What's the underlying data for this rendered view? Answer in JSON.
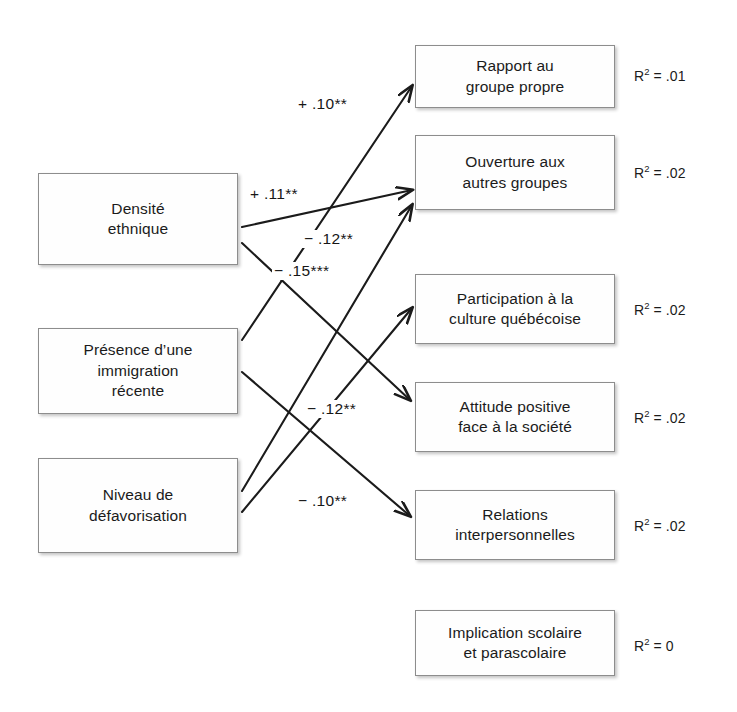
{
  "diagram": {
    "kind": "path-analysis-diagram",
    "language": "fr",
    "background_color": "#ffffff",
    "line_color": "#1b1b1b",
    "box_border_color": "#8d8d8d"
  },
  "predictors": [
    {
      "id": "densite-ethnique",
      "label": "Densité\nethnique",
      "x": 38,
      "y": 173,
      "w": 200,
      "h": 92
    },
    {
      "id": "immigration-recente",
      "label": "Présence d’une\nimmigration\nrécente",
      "x": 38,
      "y": 328,
      "w": 200,
      "h": 86
    },
    {
      "id": "niveau-defavorisation",
      "label": "Niveau de\ndéfavorisation",
      "x": 38,
      "y": 458,
      "w": 200,
      "h": 95
    }
  ],
  "outcomes": [
    {
      "id": "rapport-groupe-propre",
      "label": "Rapport au\ngroupe propre",
      "x": 415,
      "y": 45,
      "w": 200,
      "h": 63,
      "r2_prefix": "R",
      "r2_exp": "2",
      "r2_value": " = .01",
      "r2_x": 634,
      "r2_y": 68
    },
    {
      "id": "ouverture-autres-groupes",
      "label": "Ouverture aux\nautres groupes",
      "x": 415,
      "y": 135,
      "w": 200,
      "h": 75,
      "r2_prefix": "R",
      "r2_exp": "2",
      "r2_value": " = .02",
      "r2_x": 634,
      "r2_y": 165,
      "r2_v2": " = .02"
    },
    {
      "id": "participation-culture-quebecoise",
      "label": "Participation à la\nculture québécoise",
      "x": 415,
      "y": 274,
      "w": 200,
      "h": 70,
      "r2_prefix": "R",
      "r2_exp": "2",
      "r2_value": " = .02",
      "r2_x": 634,
      "r2_y": 302
    },
    {
      "id": "attitude-positive-societe",
      "label": "Attitude positive\nface à la société",
      "x": 415,
      "y": 382,
      "w": 200,
      "h": 70,
      "r2_prefix": "R",
      "r2_exp": "2",
      "r2_value": " = .02",
      "r2_x": 634,
      "r2_y": 410
    },
    {
      "id": "relations-interpersonnelles",
      "label": "Relations\ninterpersonnelles",
      "x": 415,
      "y": 490,
      "w": 200,
      "h": 70,
      "r2_prefix": "R",
      "r2_exp": "2",
      "r2_value": " = .02",
      "r2_x": 634,
      "r2_y": 518
    },
    {
      "id": "implication-scolaire",
      "label": "Implication scolaire\net parascolaire",
      "x": 415,
      "y": 610,
      "w": 200,
      "h": 66,
      "r2_prefix": "R",
      "r2_exp": "2",
      "r2_value": " = 0",
      "r2_x": 634,
      "r2_y": 638
    }
  ],
  "paths": [
    {
      "id": "path-immigration-to-rapport",
      "from": "immigration-recente",
      "to": "rapport-groupe-propre",
      "coefficient": "+ .10**",
      "sign": "positive",
      "x1": 242,
      "y1": 340,
      "x2": 412,
      "y2": 86,
      "label_x": 296,
      "label_y": 95
    },
    {
      "id": "path-densite-to-ouverture",
      "from": "densite-ethnique",
      "to": "ouverture-autres-groupes",
      "coefficient": "+ .11**",
      "sign": "positive",
      "x1": 242,
      "y1": 227,
      "x2": 412,
      "y2": 190,
      "label_x": 248,
      "label_y": 185
    },
    {
      "id": "path-densite-to-attitude",
      "from": "densite-ethnique",
      "to": "attitude-positive-societe",
      "coefficient": "− .12**",
      "sign": "negative",
      "x1": 242,
      "y1": 243,
      "x2": 410,
      "y2": 400,
      "label_x": 302,
      "label_y": 230
    },
    {
      "id": "path-defavorisation-to-ouverture",
      "from": "niveau-defavorisation",
      "to": "ouverture-autres-groupes",
      "coefficient": "− .15***",
      "sign": "negative",
      "x1": 242,
      "y1": 491,
      "x2": 412,
      "y2": 205,
      "label_x": 272,
      "label_y": 262
    },
    {
      "id": "path-defavorisation-to-participation",
      "from": "niveau-defavorisation",
      "to": "participation-culture-quebecoise",
      "coefficient": "− .12**",
      "sign": "negative",
      "x1": 242,
      "y1": 512,
      "x2": 412,
      "y2": 308,
      "label_x": 305,
      "label_y": 400
    },
    {
      "id": "path-immigration-to-relations",
      "from": "immigration-recente",
      "to": "relations-interpersonnelles",
      "coefficient": "− .10**",
      "sign": "negative",
      "x1": 242,
      "y1": 372,
      "x2": 410,
      "y2": 516,
      "label_x": 296,
      "label_y": 492
    }
  ]
}
